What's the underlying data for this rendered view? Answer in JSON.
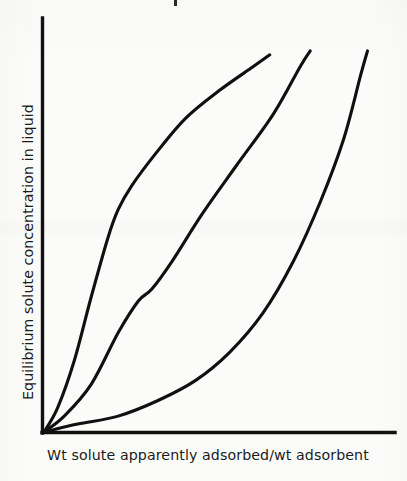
{
  "figure": {
    "background_color": "#fbfbfa",
    "ink_color": "#111111",
    "x_axis_label": "Wt solute apparently adsorbed/wt adsorbent",
    "y_axis_label": "Equilibrium solute concentration in liquid",
    "cropped_caption_fragment": ""
  },
  "chart_data": {
    "type": "line",
    "title": "",
    "xlabel": "Wt solute apparently adsorbed/wt adsorbent",
    "ylabel": "Equilibrium solute concentration in liquid",
    "xlim": [
      0,
      1
    ],
    "ylim": [
      0,
      1
    ],
    "grid": false,
    "legend": "none",
    "tick_labels": {
      "x": [],
      "y": []
    },
    "annotations": [],
    "series": [
      {
        "name": "curve-1-strongly-favorable",
        "description": "Steeply rising curve with a sharp knee at low adsorbent loading; most favorable isotherm.",
        "x": [
          0.0,
          0.04,
          0.09,
          0.14,
          0.19,
          0.22,
          0.26,
          0.33,
          0.42,
          0.52,
          0.62,
          0.67
        ],
        "y": [
          0.0,
          0.06,
          0.18,
          0.34,
          0.49,
          0.56,
          0.62,
          0.7,
          0.79,
          0.86,
          0.92,
          0.95
        ]
      },
      {
        "name": "curve-2-sigmoidal",
        "description": "S-shaped isotherm with an intermediate shoulder where the slope flattens before rising again.",
        "x": [
          0.0,
          0.06,
          0.14,
          0.22,
          0.28,
          0.32,
          0.38,
          0.47,
          0.57,
          0.68,
          0.76,
          0.79
        ],
        "y": [
          0.0,
          0.04,
          0.12,
          0.25,
          0.33,
          0.36,
          0.43,
          0.55,
          0.67,
          0.8,
          0.92,
          0.96
        ]
      },
      {
        "name": "curve-3-unfavorable",
        "description": "Shallow convex curve hugging the abscissa before turning sharply upward; least favorable isotherm.",
        "x": [
          0.0,
          0.1,
          0.22,
          0.34,
          0.45,
          0.55,
          0.65,
          0.74,
          0.82,
          0.89,
          0.94,
          0.96
        ],
        "y": [
          0.0,
          0.02,
          0.04,
          0.08,
          0.13,
          0.2,
          0.3,
          0.43,
          0.58,
          0.74,
          0.9,
          0.96
        ]
      }
    ]
  }
}
